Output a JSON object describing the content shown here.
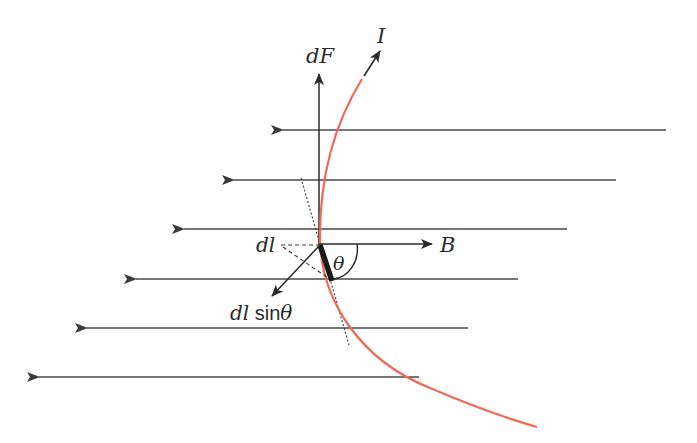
{
  "figure": {
    "type": "physics-diagram"
  },
  "labels": {
    "force": "dF",
    "current": "I",
    "field": "B",
    "element": "dl",
    "angle": "θ",
    "projection_italic": "dl",
    "projection_func": " sin",
    "projection_angle": "θ"
  },
  "colors": {
    "field_lines": "#4a4a4a",
    "wire": "#ee6a55",
    "element": "#1a1a1a",
    "text": "#2a2a2a",
    "background": "#ffffff"
  },
  "field_lines": [
    {
      "x_tip": 281,
      "x_end": 666,
      "y": 130
    },
    {
      "x_tip": 232,
      "x_end": 616,
      "y": 180
    },
    {
      "x_tip": 182,
      "x_end": 567,
      "y": 229
    },
    {
      "x_tip": 134,
      "x_end": 518,
      "y": 279
    },
    {
      "x_tip": 85,
      "x_end": 468,
      "y": 328
    },
    {
      "x_tip": 37,
      "x_end": 419,
      "y": 377
    }
  ]
}
